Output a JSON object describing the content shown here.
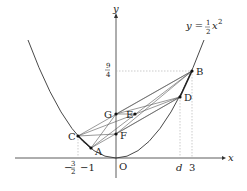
{
  "diagram": {
    "curve_label": "y = ½x²",
    "curve_label_parts": {
      "lhs": "y =",
      "num": "1",
      "den": "2",
      "var": "x",
      "exp": "2"
    },
    "axes": {
      "x_label": "x",
      "y_label": "y",
      "origin_label": "O"
    },
    "x_ticks": [
      {
        "label_num": "3",
        "label_den": "2",
        "negative": true,
        "value": -1.5
      },
      {
        "label": "−1",
        "value": -1
      },
      {
        "label": "d",
        "value": 2.5
      },
      {
        "label": "3",
        "value": 3
      }
    ],
    "y_ticks": [
      {
        "label_num": "9",
        "label_den": "4",
        "value": 2.25
      }
    ],
    "points": [
      {
        "name": "A",
        "label": "A"
      },
      {
        "name": "B",
        "label": "B"
      },
      {
        "name": "C",
        "label": "C"
      },
      {
        "name": "D",
        "label": "D"
      },
      {
        "name": "E",
        "label": "E"
      },
      {
        "name": "F",
        "label": "F"
      },
      {
        "name": "G",
        "label": "G"
      }
    ],
    "colors": {
      "stroke": "#333333",
      "guide": "#999999"
    }
  }
}
